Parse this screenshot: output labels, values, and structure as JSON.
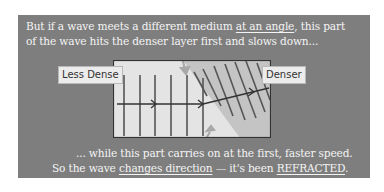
{
  "colors": {
    "panel_bg": "#7e7e7e",
    "text": "#f4f4f4",
    "less_dense_region": "#e4e4e4",
    "denser_region": "#c4c4c4",
    "wavefront": "#555555",
    "ray": "#333333",
    "pointer_arrow": "#a8a8a8"
  },
  "top_text": {
    "line1_a": "But if a wave meets a different medium ",
    "line1_u": "at an angle",
    "line1_b": ", this part",
    "line2": "of the wave hits the denser layer first and slows down..."
  },
  "diagram": {
    "label_left": "Less Dense",
    "label_right": "Denser",
    "icons": [
      "pointer-arrow-top",
      "pointer-arrow-bottom",
      "wave-ray-arrow"
    ]
  },
  "bottom_text": {
    "line1": "... while this part carries on at the first, faster speed.",
    "line2_a": "So the wave ",
    "line2_u1": "changes direction",
    "line2_b": " — it's been ",
    "line2_u2": "REFRACTED",
    "line2_c": "."
  }
}
